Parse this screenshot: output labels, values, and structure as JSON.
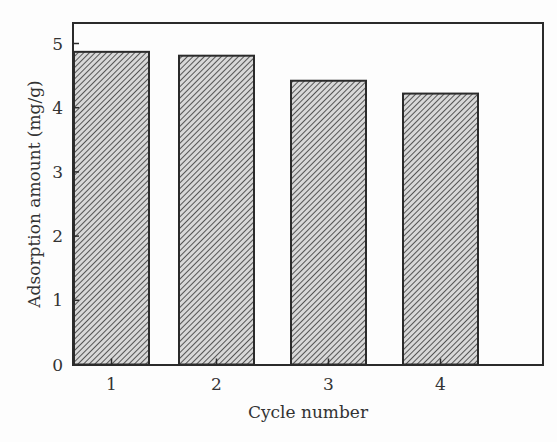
{
  "chart_data": {
    "type": "bar",
    "title": "",
    "xlabel": "Cycle number",
    "ylabel": "Adsorption amount (mg/g)",
    "categories": [
      "1",
      "2",
      "3",
      "4"
    ],
    "values": [
      4.87,
      4.81,
      4.42,
      4.22
    ],
    "ylim": [
      0,
      5.3
    ],
    "yticks": [
      0,
      1,
      2,
      3,
      4,
      5
    ],
    "grid": false,
    "legend": null,
    "bar_fill": "diagonal hatch (gray)",
    "colors": {
      "bar_fill": "#9a9a9a",
      "bar_edge": "#2b2b2b",
      "frame": "#2b2b2b",
      "background": "#fdfdfd"
    }
  }
}
